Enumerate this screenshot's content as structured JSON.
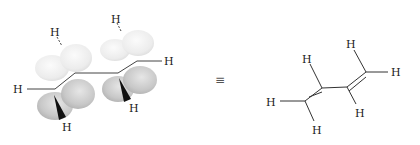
{
  "diagram": {
    "equivalence_symbol": "≡",
    "orbital_model": {
      "atoms": {
        "h_left": "H",
        "h_top_left": "H",
        "h_top_right": "H",
        "h_right": "H",
        "h_wedge_1": "H",
        "h_wedge_2": "H"
      },
      "colors": {
        "lobe_light": "#ececec",
        "lobe_dark": "#b8b8b8",
        "bond": "#444444"
      }
    },
    "line_structure": {
      "atoms": {
        "h_c1_left": "H",
        "h_c1_bottom": "H",
        "h_c2_top": "H",
        "h_c3_bottom": "H",
        "h_c4_top": "H",
        "h_c4_right": "H"
      }
    }
  }
}
